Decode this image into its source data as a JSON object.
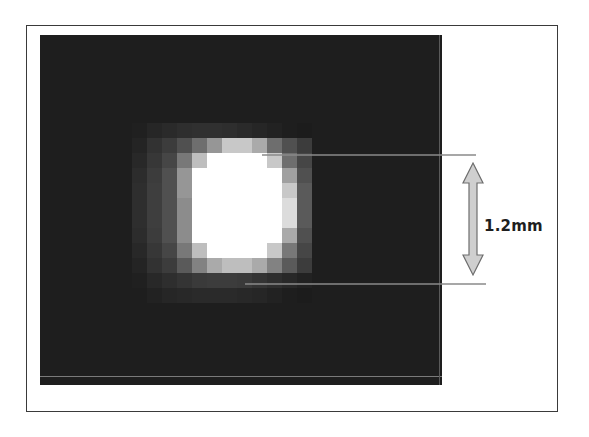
{
  "figure": {
    "measurement_label": "1.2mm",
    "colors": {
      "background": "#ffffff",
      "frame": "#3a3a3a",
      "image_background": "#1b1b1b",
      "guide_line": "#8a8a8a",
      "arrow_fill": "#cfcfcf",
      "arrow_stroke": "#6e6e6e",
      "label": "#1e1e1e"
    },
    "guide_lines": [
      {
        "name": "upper-boundary-line",
        "x1": 262,
        "x2": 476,
        "y": 155
      },
      {
        "name": "lower-boundary-line",
        "x1": 245,
        "x2": 486,
        "y": 284
      }
    ],
    "arrow": {
      "x": 473,
      "y_top": 163,
      "y_bottom": 275
    }
  },
  "chart_data": {
    "type": "heatmap",
    "title": "",
    "annotation": "1.2mm",
    "grid": {
      "cell_px": 15,
      "origin_x": 42,
      "origin_y": 33,
      "col_start_index": 6,
      "row_start_index": 6,
      "background_level": 30,
      "values": [
        [
          32,
          38,
          42,
          46,
          48,
          48,
          46,
          42,
          38,
          34,
          30,
          28
        ],
        [
          36,
          50,
          60,
          80,
          110,
          150,
          200,
          200,
          170,
          110,
          80,
          60
        ],
        [
          40,
          55,
          70,
          120,
          190,
          255,
          255,
          255,
          255,
          200,
          110,
          70
        ],
        [
          44,
          60,
          80,
          150,
          255,
          255,
          255,
          255,
          255,
          255,
          160,
          80
        ],
        [
          46,
          62,
          80,
          150,
          255,
          255,
          255,
          255,
          255,
          255,
          200,
          90
        ],
        [
          46,
          62,
          80,
          140,
          255,
          255,
          255,
          255,
          255,
          255,
          220,
          90
        ],
        [
          46,
          62,
          80,
          140,
          255,
          255,
          255,
          255,
          255,
          255,
          220,
          90
        ],
        [
          44,
          60,
          80,
          140,
          255,
          255,
          255,
          255,
          255,
          255,
          170,
          80
        ],
        [
          40,
          55,
          70,
          120,
          190,
          255,
          255,
          255,
          255,
          200,
          120,
          70
        ],
        [
          36,
          50,
          60,
          90,
          130,
          170,
          190,
          190,
          170,
          130,
          90,
          60
        ],
        [
          32,
          40,
          46,
          52,
          58,
          60,
          60,
          58,
          52,
          46,
          40,
          34
        ],
        [
          30,
          34,
          38,
          40,
          42,
          42,
          42,
          40,
          38,
          34,
          30,
          28
        ]
      ]
    }
  }
}
